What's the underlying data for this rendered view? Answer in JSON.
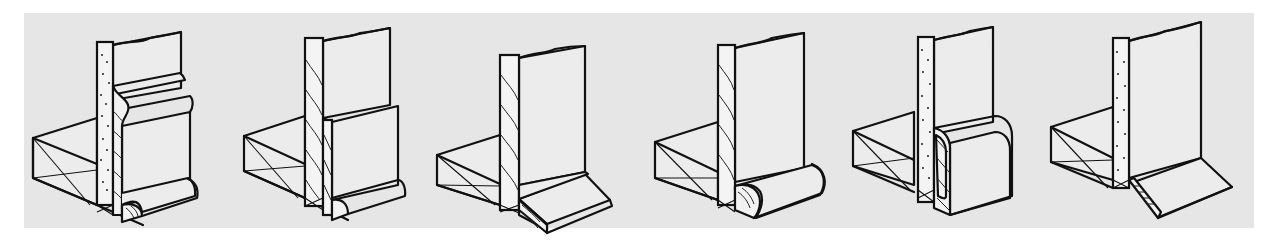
{
  "figure": {
    "background_color": "#e6e6e6",
    "line_color": "#111111",
    "panels": [
      {
        "id": 1,
        "wall": "plaster",
        "base": "ogee-top baseboard with quarter-round shoe"
      },
      {
        "id": 2,
        "wall": "wood",
        "base": "square baseboard with quarter-round shoe"
      },
      {
        "id": 3,
        "wall": "wood",
        "base": "beveled base molding"
      },
      {
        "id": 4,
        "wall": "wood",
        "base": "half-round / quarter-round base molding"
      },
      {
        "id": 5,
        "wall": "plaster",
        "base": "rounded cove base"
      },
      {
        "id": 6,
        "wall": "plaster",
        "base": "angled (splayed) base strip"
      }
    ]
  }
}
